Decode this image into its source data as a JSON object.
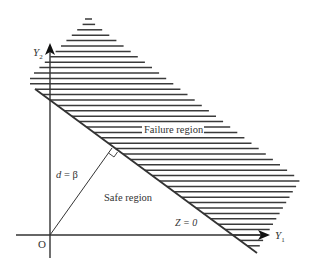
{
  "diagram": {
    "type": "reliability-limit-state",
    "colors": {
      "stroke": "#333333",
      "hatch": "#3a3a3a",
      "background": "#ffffff"
    },
    "axes": {
      "x_label": "Y",
      "x_sub": "1",
      "y_label": "Y",
      "y_sub": "2",
      "origin_label": "O"
    },
    "labels": {
      "failure_region": "Failure region",
      "safe_region": "Safe region",
      "limit_state": "Z = 0",
      "distance_d": "d",
      "distance_eq": " = β"
    },
    "geometry": {
      "origin": [
        50,
        235
      ],
      "y_axis": {
        "x": 50,
        "top": 44,
        "bottom": 258
      },
      "x_axis": {
        "y": 235,
        "left": 16,
        "right": 268
      },
      "limit_line": {
        "start": [
          35,
          89
        ],
        "end": [
          257,
          253
        ]
      },
      "beta_foot": [
        112,
        148
      ],
      "hatch": {
        "top_y": 19,
        "bottom_y": 251,
        "spacing": 5.4,
        "apex": [
          88,
          19
        ],
        "right_corner": [
          300,
          180
        ],
        "bottom_right": [
          256,
          252
        ]
      }
    }
  }
}
